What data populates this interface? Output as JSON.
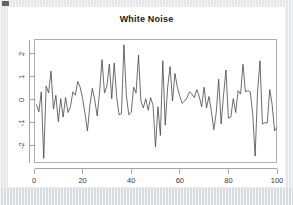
{
  "chart_data": {
    "type": "line",
    "title": "White Noise",
    "xlabel": "",
    "ylabel": "",
    "xlim": [
      0,
      100
    ],
    "ylim": [
      -2.75,
      2.65
    ],
    "grid": false,
    "legend": false,
    "legend_position": "none",
    "line_color": "#3c3c3e",
    "frame": "box",
    "x_tick_labels": [
      "0",
      "20",
      "40",
      "60",
      "80",
      "100"
    ],
    "x_ticks": [
      0,
      20,
      40,
      60,
      80,
      100
    ],
    "y_tick_labels": [
      "2",
      "1",
      "0",
      "-1",
      "-2"
    ],
    "y_ticks": [
      2,
      1,
      0,
      -1,
      -2
    ],
    "y_tick_rotation": 90,
    "series": [
      {
        "name": "White Noise",
        "x": [
          1,
          2,
          3,
          4,
          5,
          6,
          7,
          8,
          9,
          10,
          11,
          12,
          13,
          14,
          15,
          16,
          17,
          18,
          19,
          20,
          21,
          22,
          23,
          24,
          25,
          26,
          27,
          28,
          29,
          30,
          31,
          32,
          33,
          34,
          35,
          36,
          37,
          38,
          39,
          40,
          41,
          42,
          43,
          44,
          45,
          46,
          47,
          48,
          49,
          50,
          51,
          52,
          53,
          54,
          55,
          56,
          57,
          58,
          59,
          60,
          61,
          62,
          63,
          64,
          65,
          66,
          67,
          68,
          69,
          70,
          71,
          72,
          73,
          74,
          75,
          76,
          77,
          78,
          79,
          80,
          81,
          82,
          83,
          84,
          85,
          86,
          87,
          88,
          89,
          90,
          91,
          92,
          93,
          94,
          95,
          96,
          97,
          98,
          99,
          100
        ],
        "values": [
          -0.2,
          -0.52,
          0.35,
          -2.55,
          0.6,
          0.3,
          1.25,
          -0.4,
          0.2,
          -0.95,
          0.05,
          -0.75,
          0.1,
          -0.55,
          -0.3,
          0.35,
          0.2,
          0.8,
          0.55,
          0.05,
          -0.6,
          -1.35,
          -0.25,
          0.5,
          0.0,
          -0.7,
          0.35,
          1.75,
          0.3,
          0.6,
          1.55,
          0.05,
          1.6,
          0.15,
          -0.65,
          -0.6,
          2.4,
          0.2,
          -0.65,
          -0.55,
          0.55,
          0.3,
          1.95,
          -0.05,
          -0.35,
          0.05,
          -0.45,
          0.1,
          -0.25,
          -2.05,
          -0.3,
          -1.55,
          1.7,
          -1.1,
          0.55,
          1.45,
          -0.05,
          1.15,
          0.55,
          0.15,
          -0.15,
          -0.05,
          0.1,
          0.35,
          0.25,
          0.1,
          0.45,
          0.15,
          -0.3,
          0.55,
          -0.35,
          0.15,
          -0.5,
          -1.3,
          -0.55,
          0.9,
          -1.05,
          0.2,
          1.3,
          -0.8,
          -0.75,
          0.05,
          -0.55,
          0.4,
          0.25,
          1.55,
          0.35,
          0.4,
          0.35,
          -0.6,
          -2.45,
          0.35,
          1.7,
          -1.05,
          -1.0,
          -1.0,
          0.45,
          -0.2,
          -1.35,
          -1.2
        ]
      }
    ]
  },
  "plot_geometry": {
    "box_left": 26,
    "box_top": 32,
    "box_right": 269,
    "box_bottom": 156
  }
}
